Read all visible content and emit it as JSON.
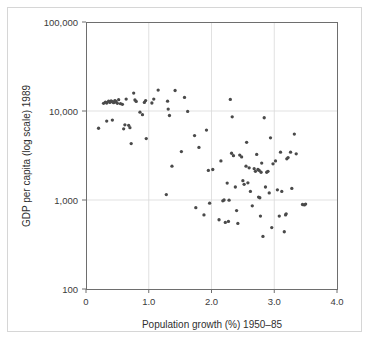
{
  "chart_data": {
    "type": "scatter",
    "title": "",
    "xlabel": "Population growth (%) 1950–85",
    "ylabel": "GDP per capita (log scale) 1989",
    "xlim": [
      0,
      4.0
    ],
    "ylim": [
      100,
      100000
    ],
    "yscale": "log",
    "xscale": "linear",
    "grid": "light gridlines at x = 1.0, 2.0, 3.0 and y = 1,000 and 10,000",
    "legend": "none",
    "xticks": [
      "0",
      "1.0",
      "2.0",
      "3.0",
      "4.0"
    ],
    "xtick_values": [
      0,
      1.0,
      2.0,
      3.0,
      4.0
    ],
    "yticks": [
      "100",
      "1,000",
      "10,000",
      "100,000"
    ],
    "ytick_values": [
      100,
      1000,
      10000,
      100000
    ],
    "marker": {
      "shape": "circle",
      "color": "#4a4a4a",
      "size_px": 2.6
    },
    "series": [
      {
        "name": "Countries",
        "points": [
          [
            0.2,
            6400
          ],
          [
            0.28,
            12200
          ],
          [
            0.31,
            12600
          ],
          [
            0.33,
            12300
          ],
          [
            0.36,
            12900
          ],
          [
            0.38,
            12500
          ],
          [
            0.4,
            13000
          ],
          [
            0.42,
            12700
          ],
          [
            0.44,
            12400
          ],
          [
            0.46,
            13100
          ],
          [
            0.48,
            12600
          ],
          [
            0.5,
            12200
          ],
          [
            0.33,
            7700
          ],
          [
            0.42,
            7900
          ],
          [
            0.47,
            12900
          ],
          [
            0.52,
            13400
          ],
          [
            0.55,
            12100
          ],
          [
            0.58,
            11900
          ],
          [
            0.6,
            6300
          ],
          [
            0.62,
            7000
          ],
          [
            0.64,
            13600
          ],
          [
            0.68,
            6900
          ],
          [
            0.7,
            6500
          ],
          [
            0.72,
            4300
          ],
          [
            0.76,
            15900
          ],
          [
            0.78,
            13300
          ],
          [
            0.8,
            12800
          ],
          [
            0.86,
            9700
          ],
          [
            0.9,
            9100
          ],
          [
            0.93,
            12500
          ],
          [
            0.95,
            13100
          ],
          [
            0.96,
            4900
          ],
          [
            1.05,
            12300
          ],
          [
            1.08,
            13600
          ],
          [
            1.15,
            17200
          ],
          [
            1.28,
            1150
          ],
          [
            1.3,
            12900
          ],
          [
            1.31,
            10500
          ],
          [
            1.33,
            8900
          ],
          [
            1.37,
            2400
          ],
          [
            1.42,
            17000
          ],
          [
            1.52,
            3500
          ],
          [
            1.57,
            14200
          ],
          [
            1.62,
            9900
          ],
          [
            1.73,
            5300
          ],
          [
            1.75,
            820
          ],
          [
            1.8,
            3900
          ],
          [
            1.88,
            680
          ],
          [
            1.92,
            6100
          ],
          [
            1.95,
            2150
          ],
          [
            1.97,
            920
          ],
          [
            2.02,
            2200
          ],
          [
            2.12,
            600
          ],
          [
            2.15,
            2750
          ],
          [
            2.18,
            980
          ],
          [
            2.2,
            1000
          ],
          [
            2.22,
            560
          ],
          [
            2.25,
            1550
          ],
          [
            2.27,
            575
          ],
          [
            2.28,
            995
          ],
          [
            2.3,
            13500
          ],
          [
            2.32,
            3350
          ],
          [
            2.33,
            8600
          ],
          [
            2.35,
            3150
          ],
          [
            2.38,
            1400
          ],
          [
            2.4,
            760
          ],
          [
            2.42,
            545
          ],
          [
            2.45,
            3200
          ],
          [
            2.48,
            3050
          ],
          [
            2.5,
            1650
          ],
          [
            2.52,
            1500
          ],
          [
            2.55,
            2400
          ],
          [
            2.56,
            4450
          ],
          [
            2.58,
            1560
          ],
          [
            2.6,
            2300
          ],
          [
            2.62,
            1250
          ],
          [
            2.65,
            860
          ],
          [
            2.68,
            2250
          ],
          [
            2.7,
            2100
          ],
          [
            2.72,
            3250
          ],
          [
            2.74,
            2200
          ],
          [
            2.75,
            1080
          ],
          [
            2.76,
            2150
          ],
          [
            2.77,
            1060
          ],
          [
            2.78,
            660
          ],
          [
            2.79,
            2050
          ],
          [
            2.8,
            2600
          ],
          [
            2.82,
            390
          ],
          [
            2.84,
            8400
          ],
          [
            2.86,
            1400
          ],
          [
            2.88,
            2050
          ],
          [
            2.9,
            2100
          ],
          [
            2.92,
            1200
          ],
          [
            2.94,
            5000
          ],
          [
            2.96,
            490
          ],
          [
            2.98,
            2550
          ],
          [
            3.02,
            2750
          ],
          [
            3.05,
            1300
          ],
          [
            3.08,
            660
          ],
          [
            3.1,
            3450
          ],
          [
            3.12,
            1250
          ],
          [
            3.16,
            440
          ],
          [
            3.18,
            680
          ],
          [
            3.19,
            700
          ],
          [
            3.2,
            2900
          ],
          [
            3.22,
            3000
          ],
          [
            3.26,
            3450
          ],
          [
            3.28,
            1350
          ],
          [
            3.32,
            5500
          ],
          [
            3.35,
            3300
          ],
          [
            3.45,
            890
          ],
          [
            3.48,
            880
          ],
          [
            3.5,
            900
          ]
        ]
      }
    ]
  },
  "axes": {
    "y_title": "GDP per capita (log scale) 1989",
    "x_title": "Population growth (%) 1950–85",
    "y_labels": [
      "100,000",
      "10,000",
      "1,000",
      "100"
    ],
    "x_labels": [
      "0",
      "1.0",
      "2.0",
      "3.0",
      "4.0"
    ]
  },
  "colors": {
    "marker": "#4a4a4a",
    "frame": "#6e6e6e",
    "grid": "#d9d9d9",
    "border": "#d6d6d6",
    "text": "#2f2f2f",
    "background": "#ffffff"
  }
}
